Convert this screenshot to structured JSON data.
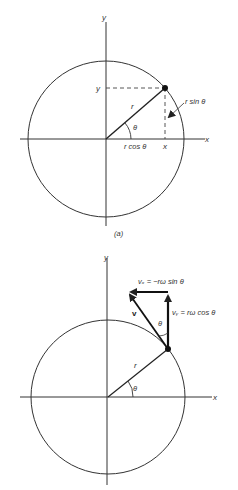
{
  "figure": {
    "panel_a": {
      "caption": "(a)",
      "axis_x_label": "x",
      "axis_y_label": "y",
      "point_y_label": "y",
      "point_x_label": "x",
      "radius_label": "r",
      "angle_label": "θ",
      "cos_label": "r cos θ",
      "sin_label": "r sin θ"
    },
    "panel_b": {
      "axis_x_label": "x",
      "axis_y_label": "y",
      "radius_label": "r",
      "angle_label": "θ",
      "vector_label": "v",
      "vector_angle_label": "θ",
      "vx_label": "vₓ = −rω sin θ",
      "vy_label": "vᵧ = rω cos θ"
    }
  }
}
